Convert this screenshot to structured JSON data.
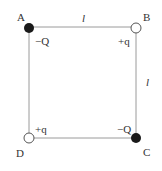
{
  "diagram": {
    "side_top_label": "l",
    "side_right_label": "l",
    "vertices": [
      {
        "name": "A",
        "charge": "−Q",
        "fill": "#1a1a1a",
        "type": "negative"
      },
      {
        "name": "B",
        "charge": "+q",
        "fill": "#ffffff",
        "type": "positive"
      },
      {
        "name": "C",
        "charge": "−Q",
        "fill": "#1a1a1a",
        "type": "negative"
      },
      {
        "name": "D",
        "charge": "+q",
        "fill": "#ffffff",
        "type": "positive"
      }
    ],
    "colors": {
      "line": "#9a9a9a",
      "text": "#333333",
      "dark": "#1a1a1a"
    }
  }
}
